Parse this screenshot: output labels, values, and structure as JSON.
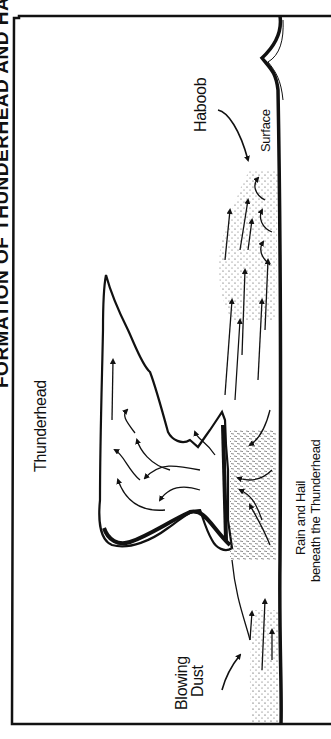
{
  "diagram": {
    "title": "FORMATION OF THUNDERHEAD AND HABOOB",
    "orientation": "rotated 90 degrees counter-clockwise",
    "labels": {
      "thunderhead": "Thunderhead",
      "haboob": "Haboob",
      "surface": "Surface",
      "blowing_dust_line1": "Blowing",
      "blowing_dust_line2": "Dust",
      "rain_line1": "Rain and Hail",
      "rain_line2": "beneath the Thunderhead"
    },
    "colors": {
      "ink": "#111111",
      "background": "#ffffff"
    }
  }
}
